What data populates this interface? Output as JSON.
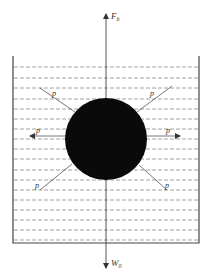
{
  "diagram": {
    "forces": {
      "buoyancy": {
        "symbol": "F",
        "subscript": "b"
      },
      "weight": {
        "symbol": "W",
        "subscript": "0"
      },
      "pressure_label": "p"
    },
    "pressure_arrows": [
      {
        "id": "upper-left",
        "label": "p"
      },
      {
        "id": "upper-right",
        "label": "p"
      },
      {
        "id": "left",
        "label": "p"
      },
      {
        "id": "right",
        "label": "p"
      },
      {
        "id": "lower-left",
        "label": "p"
      },
      {
        "id": "lower-right",
        "label": "p"
      }
    ],
    "colors": {
      "line": "#555555",
      "ball": "#0a0a0a",
      "dash": "#888888",
      "background": "#ffffff"
    }
  }
}
